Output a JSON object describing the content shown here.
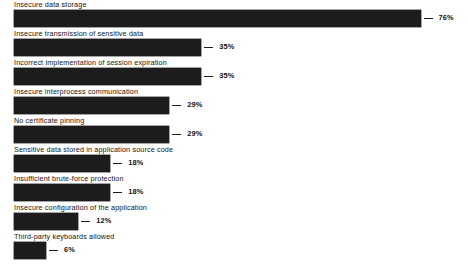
{
  "chart_data": {
    "type": "bar",
    "orientation": "horizontal",
    "title": "",
    "subtitle": "",
    "xlabel": "",
    "ylabel": "",
    "xlim": [
      0,
      80
    ],
    "grid": false,
    "legend": null,
    "value_suffix": "%",
    "categories": [
      "Insecure data storage",
      "Insecure transmission of sensitive data",
      "Incorrect implementation of session expiration",
      "Insecure interprocess communication",
      "No certificate pinning",
      "Sensitive data stored in application source code",
      "Insufficient brute-force protection",
      "Insecure configuration of the application",
      "Third-party keyboards allowed"
    ],
    "values": [
      76,
      35,
      35,
      29,
      29,
      18,
      18,
      12,
      6
    ],
    "value_labels": [
      "76%",
      "35%",
      "35%",
      "29%",
      "29%",
      "18%",
      "18%",
      "12%",
      "6%"
    ],
    "bar_color": "#1c1c1c",
    "background_color": "#ffffff",
    "text_color": "#141414"
  },
  "layout": {
    "bar_origin_x": 14,
    "row_pitch": 29,
    "first_row_top": 10,
    "bar_height": 17,
    "px_per_percent": 5.35,
    "leader_gap": 3,
    "label_gap": 6
  }
}
